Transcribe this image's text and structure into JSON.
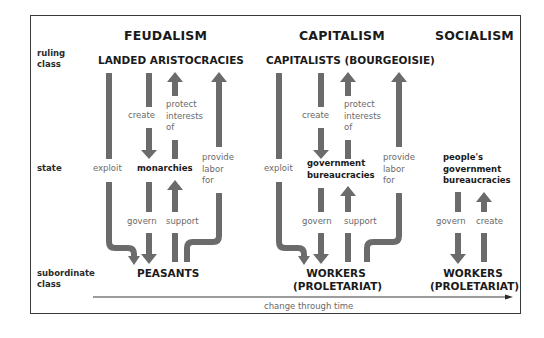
{
  "row_labels": {
    "ruling": [
      "ruling",
      "class"
    ],
    "state": "state",
    "subordinate": [
      "subordinate",
      "class"
    ]
  },
  "columns": {
    "feudalism": {
      "title": "FEUDALISM",
      "ruling": "LANDED ARISTOCRACIES",
      "state": "monarchies",
      "subordinate": "PEASANTS",
      "labels": {
        "exploit": "exploit",
        "create": "create",
        "protect": [
          "protect",
          "interests",
          "of"
        ],
        "provide": [
          "provide",
          "labor",
          "for"
        ],
        "govern": "govern",
        "support": "support"
      }
    },
    "capitalism": {
      "title": "CAPITALISM",
      "ruling": "CAPITALISTS (BOURGEOISIE)",
      "state": [
        "government",
        "bureaucracies"
      ],
      "subordinate": [
        "WORKERS",
        "(PROLETARIAT)"
      ],
      "labels": {
        "exploit": "exploit",
        "create": "create",
        "protect": [
          "protect",
          "interests",
          "of"
        ],
        "provide": [
          "provide",
          "labor",
          "for"
        ],
        "govern": "govern",
        "support": "support"
      }
    },
    "socialism": {
      "title": "SOCIALISM",
      "state": [
        "people's",
        "government",
        "bureaucracies"
      ],
      "subordinate": [
        "WORKERS",
        "(PROLETARIAT)"
      ],
      "labels": {
        "govern": "govern",
        "create": "create"
      }
    }
  },
  "timeline": {
    "label": "change through time"
  },
  "colors": {
    "arrow": "#6b6b6b",
    "frame": "#3a3a3a",
    "label_text": "#6a6a6a",
    "heading_text": "#1a1a1a"
  }
}
